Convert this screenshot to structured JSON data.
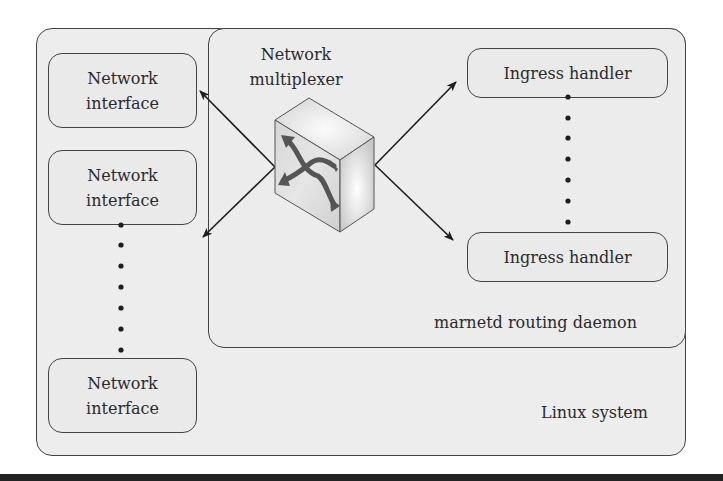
{
  "diagram": {
    "containers": {
      "linux_system": {
        "label": "Linux system"
      },
      "routing_daemon": {
        "label": "marnetd routing daemon"
      }
    },
    "multiplexer": {
      "label_line1": "Network",
      "label_line2": "multiplexer",
      "icon": "network-switch-cube-icon"
    },
    "network_interfaces": [
      {
        "line1": "Network",
        "line2": "interface"
      },
      {
        "line1": "Network",
        "line2": "interface"
      },
      {
        "line1": "Network",
        "line2": "interface"
      }
    ],
    "ingress_handlers": [
      {
        "label": "Ingress handler"
      },
      {
        "label": "Ingress handler"
      }
    ],
    "edges": [
      {
        "from": "Network multiplexer",
        "to": "Network interface (top)",
        "style": "arrow"
      },
      {
        "from": "Network multiplexer",
        "to": "Network interface (bottom)",
        "style": "arrow"
      },
      {
        "from": "Network multiplexer",
        "to": "Ingress handler (top)",
        "style": "arrow"
      },
      {
        "from": "Network multiplexer",
        "to": "Ingress handler (bottom)",
        "style": "arrow"
      }
    ],
    "ellipsis": {
      "left_column": "vertical dotted continuation between network interfaces",
      "right_column": "vertical dotted continuation between ingress handlers"
    },
    "colors": {
      "box_fill": "#ececec",
      "stroke": "#444444",
      "text": "#2a2a2a",
      "bottom_rule": "#222222"
    }
  }
}
